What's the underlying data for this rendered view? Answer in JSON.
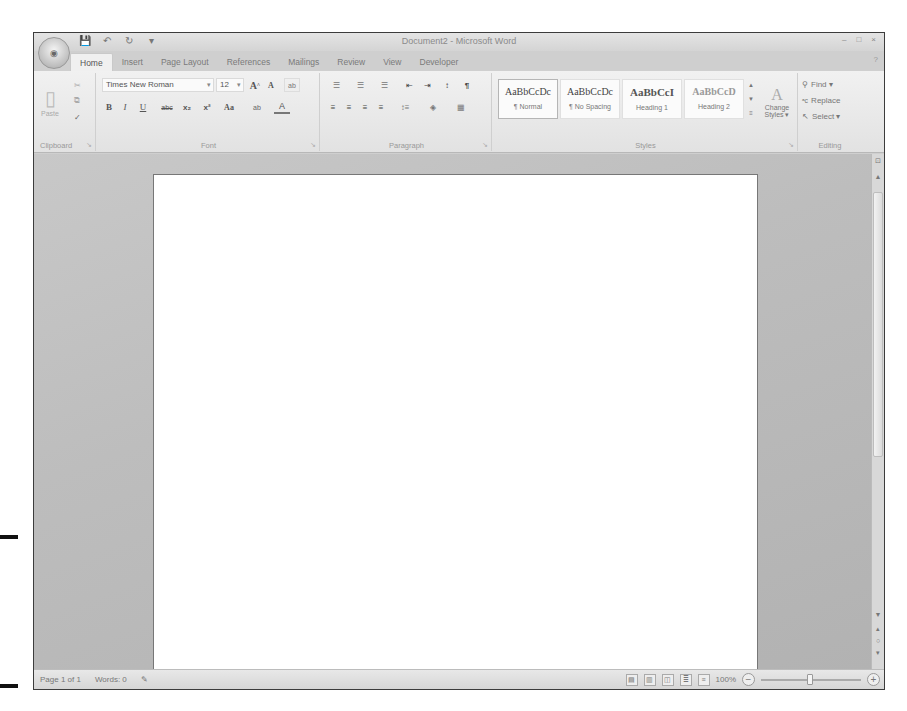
{
  "window": {
    "title": "Document2 - Microsoft Word",
    "office_button_icon": "office-logo-icon",
    "quick_access": [
      {
        "name": "save-icon",
        "glyph": "💾"
      },
      {
        "name": "undo-icon",
        "glyph": "↶"
      },
      {
        "name": "redo-icon",
        "glyph": "↻"
      },
      {
        "name": "customize-qat-icon",
        "glyph": "▾"
      }
    ],
    "controls": [
      "–",
      "□",
      "×"
    ]
  },
  "tabs": [
    "Home",
    "Insert",
    "Page Layout",
    "References",
    "Mailings",
    "Review",
    "View",
    "Developer"
  ],
  "active_tab": "Home",
  "ribbon": {
    "clipboard": {
      "label": "Clipboard",
      "paste_label": "Paste",
      "cut_icon": "✂",
      "copy_icon": "⧉",
      "format_painter_icon": "✓"
    },
    "font": {
      "label": "Font",
      "font_name": "Times New Roman",
      "font_size": "12",
      "grow_label": "A",
      "shrink_label": "A",
      "clear_label": "ab",
      "bold": "B",
      "italic": "I",
      "underline": "U",
      "strikethrough": "abc",
      "subscript": "x₂",
      "superscript": "x²",
      "change_case": "Aa",
      "highlight": "ab",
      "font_color": "A"
    },
    "paragraph": {
      "label": "Paragraph",
      "bullets": "☰",
      "numbering": "☰",
      "multilevel": "☰",
      "decrease_indent": "⇤",
      "increase_indent": "⇥",
      "sort": "↕",
      "show_marks": "¶",
      "align_left": "≡",
      "center": "≡",
      "align_right": "≡",
      "justify": "≡",
      "line_spacing": "↕≡",
      "shading": "◈",
      "borders": "▦"
    },
    "styles": {
      "label": "Styles",
      "items": [
        {
          "sample": "AaBbCcDc",
          "name": "¶ Normal"
        },
        {
          "sample": "AaBbCcDc",
          "name": "¶ No Spacing"
        },
        {
          "sample": "AaBbCcI",
          "name": "Heading 1"
        },
        {
          "sample": "AaBbCcD",
          "name": "Heading 2"
        }
      ],
      "change_styles_line1": "Change",
      "change_styles_line2": "Styles ▾"
    },
    "editing": {
      "label": "Editing",
      "find": "Find ▾",
      "replace": "Replace",
      "select": "Select ▾"
    }
  },
  "statusbar": {
    "page": "Page 1 of 1",
    "words": "Words: 0",
    "zoom": "100%",
    "zoom_minus": "−",
    "zoom_plus": "+"
  }
}
